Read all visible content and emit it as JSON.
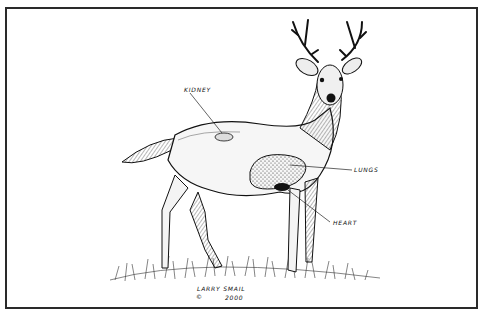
{
  "diagram": {
    "labels": [
      {
        "id": "kidney",
        "text": "KIDNEY",
        "x": 184,
        "y": 88
      },
      {
        "id": "lungs",
        "text": "LUNGS",
        "x": 354,
        "y": 168
      },
      {
        "id": "heart",
        "text": "HEART",
        "x": 333,
        "y": 221
      }
    ],
    "signature": {
      "artist": "LARRY SMAIL",
      "copyright": "©",
      "year": "2000"
    },
    "colors": {
      "ink": "#111111",
      "paper": "#ffffff",
      "border": "#2a2a2a"
    }
  }
}
